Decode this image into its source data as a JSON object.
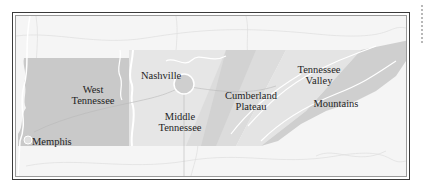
{
  "map": {
    "title": "Regions of Tennessee",
    "regions": [
      {
        "id": "west",
        "label_line1": "West",
        "label_line2": "Tennessee",
        "color": "#c9c9c9"
      },
      {
        "id": "middle",
        "label_line1": "Middle",
        "label_line2": "Tennessee",
        "color": "#e5e5e5"
      },
      {
        "id": "cumberland",
        "label_line1": "Cumberland",
        "label_line2": "Plateau",
        "color": "#dadada"
      },
      {
        "id": "valley",
        "label_line1": "Tennessee",
        "label_line2": "Valley",
        "color": "#e2e2e2"
      },
      {
        "id": "mountains",
        "label_line1": "Mountains",
        "label_line2": "",
        "color": "#d0d0d0"
      }
    ],
    "cities": [
      {
        "id": "nashville",
        "label": "Nashville"
      },
      {
        "id": "memphis",
        "label": "Memphis"
      }
    ],
    "colors": {
      "frame": "#3a3a3a",
      "background": "#f4f4f4",
      "text": "#1e1e1e",
      "river": "#ffffff",
      "terrain_lines": "#d4d4d4"
    }
  }
}
